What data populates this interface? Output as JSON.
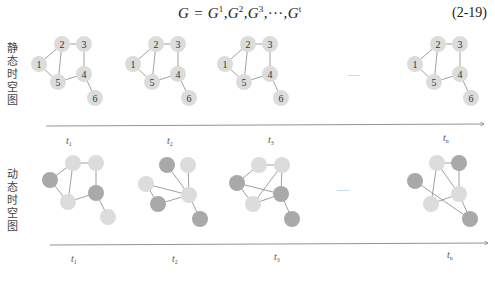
{
  "equation": {
    "lhs": "G",
    "rhs_terms": [
      "G",
      "G",
      "G",
      "G"
    ],
    "superscripts": [
      "1",
      "2",
      "3",
      "t"
    ],
    "ellipsis": "···",
    "number": "(2-19)"
  },
  "rows": [
    {
      "label": "静态时空图",
      "type": "static",
      "ellipsis": "......",
      "time_labels": [
        {
          "base": "t",
          "sub": "1"
        },
        {
          "base": "t",
          "sub": "2"
        },
        {
          "base": "t",
          "sub": "3"
        },
        {
          "base": "t",
          "sub": "n"
        }
      ]
    },
    {
      "label": "动态时空图",
      "type": "dynamic",
      "ellipsis": "......",
      "time_labels": [
        {
          "base": "t",
          "sub": "1"
        },
        {
          "base": "t",
          "sub": "2"
        },
        {
          "base": "t",
          "sub": "3"
        },
        {
          "base": "t",
          "sub": "n"
        }
      ]
    }
  ],
  "static_graph": {
    "node_labels": [
      "1",
      "2",
      "3",
      "4",
      "5",
      "6"
    ],
    "edges": [
      [
        "1",
        "2"
      ],
      [
        "2",
        "3"
      ],
      [
        "2",
        "5"
      ],
      [
        "1",
        "5"
      ],
      [
        "3",
        "4"
      ],
      [
        "5",
        "4"
      ],
      [
        "4",
        "6"
      ]
    ]
  },
  "colors": {
    "node_light": "#dcdcdc",
    "node_dark": "#a9a9a9",
    "edge": "#777777",
    "axis": "#777777"
  }
}
